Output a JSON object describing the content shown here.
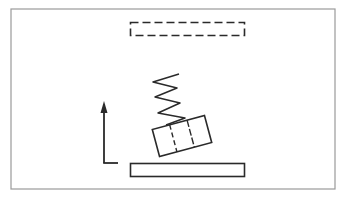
{
  "diagram": {
    "colors": {
      "background": "#ffffff",
      "frame": "#9a9a9a",
      "stroke": "#2a2a2a"
    },
    "frame": {
      "x": 11,
      "y": 9,
      "w": 324,
      "h": 180
    },
    "dashed_target": {
      "x": 130,
      "y": 22,
      "w": 115,
      "h": 14
    },
    "platform": {
      "x": 130,
      "y": 163,
      "w": 115,
      "h": 14
    },
    "arrow": {
      "x": 104,
      "y_top": 101,
      "y_bottom": 163,
      "foot_x2": 118
    },
    "block": {
      "cx": 180,
      "cy": 136,
      "w": 55,
      "h": 30,
      "angle": -15
    },
    "spring": {
      "coils": 4
    }
  }
}
